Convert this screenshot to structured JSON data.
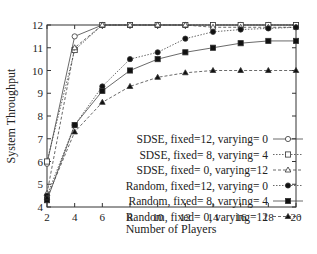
{
  "chart_data": {
    "type": "line",
    "title": "",
    "xlabel": "Number of Players",
    "ylabel": "System Throughput",
    "xlim": [
      2,
      20
    ],
    "ylim": [
      4,
      12
    ],
    "x": [
      2,
      4,
      6,
      8,
      10,
      12,
      14,
      16,
      18,
      20
    ],
    "xticks": [
      2,
      4,
      6,
      8,
      10,
      12,
      14,
      16,
      18,
      20
    ],
    "yticks": [
      4,
      5,
      6,
      7,
      8,
      9,
      10,
      11,
      12
    ],
    "grid": false,
    "legend_position": "lower right (inside)",
    "series": [
      {
        "name": "SDSE, fixed=12, varying=  0",
        "marker": "open-circle",
        "line": "solid",
        "values": [
          5.9,
          11.5,
          12.0,
          12.0,
          12.0,
          12.0,
          12.0,
          12.0,
          12.0,
          12.0
        ]
      },
      {
        "name": "SDSE, fixed=  8, varying=  4",
        "marker": "open-square",
        "line": "dotted",
        "values": [
          6.0,
          10.9,
          12.0,
          12.0,
          12.0,
          12.0,
          12.0,
          12.0,
          12.0,
          12.0
        ]
      },
      {
        "name": "SDSE, fixed=  0, varying=12",
        "marker": "open-triangle",
        "line": "dashed",
        "values": [
          4.6,
          11.0,
          12.0,
          12.0,
          12.0,
          12.0,
          11.9,
          11.9,
          11.9,
          11.9
        ]
      },
      {
        "name": "Random, fixed=12, varying=  0",
        "marker": "filled-circle",
        "line": "dotted",
        "values": [
          4.5,
          7.6,
          9.3,
          10.5,
          10.8,
          11.4,
          11.7,
          11.8,
          11.85,
          11.9
        ]
      },
      {
        "name": "Random, fixed=  8, varying=  4",
        "marker": "filled-square",
        "line": "solid",
        "values": [
          4.3,
          7.6,
          9.1,
          10.0,
          10.5,
          10.8,
          11.0,
          11.2,
          11.3,
          11.3
        ]
      },
      {
        "name": "Random, fixed=  0, varying=12",
        "marker": "filled-triangle",
        "line": "dashed",
        "values": [
          4.4,
          7.3,
          8.6,
          9.3,
          9.7,
          9.9,
          10.0,
          10.0,
          10.0,
          10.0
        ]
      }
    ]
  }
}
